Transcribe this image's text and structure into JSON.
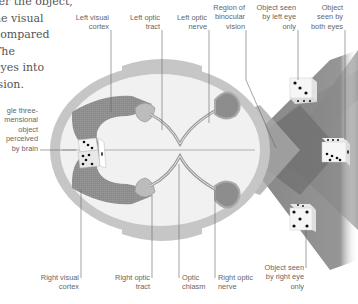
{
  "intro_text": {
    "lines": [
      "ter the object,",
      "he visual",
      "compared",
      "The",
      "eyes into",
      "ision."
    ]
  },
  "labels": {
    "left_visual_cortex": {
      "l1": "Left visual",
      "l2": "cortex"
    },
    "left_optic_tract": {
      "l1": "Left optic",
      "l2": "tract"
    },
    "left_optic_nerve": {
      "l1": "Left optic",
      "l2": "nerve"
    },
    "binocular_region": {
      "l1": "Region of",
      "l2": "binocular",
      "l3": "vision"
    },
    "left_eye_object": {
      "l1": "Object seen",
      "l2": "by left eye",
      "l3": "only"
    },
    "both_eyes_object": {
      "l1": "Object",
      "l2": "seen by",
      "l3": "both eyes"
    },
    "perceived_object": {
      "l1": "gle three-",
      "l2": "mensional",
      "l3": "object",
      "l4": "perceived",
      "l5": "by brain"
    },
    "right_visual_cortex": {
      "l1": "Right visual",
      "l2": "cortex"
    },
    "right_optic_tract": {
      "l1": "Right optic",
      "l2": "tract"
    },
    "optic_chiasm": {
      "l1": "Optic",
      "l2": "chiasm"
    },
    "right_optic_nerve": {
      "l1": "Right optic",
      "l2": "nerve"
    },
    "right_eye_object": {
      "l1": "Object seen",
      "l2": "by right eye",
      "l3": "only"
    }
  },
  "colors": {
    "skull": "#c8c8c8",
    "brain": "#f2f2f2",
    "pathway": "#8a8a8a",
    "field_light": "#b4b4b4",
    "field_mid": "#8f8f8f",
    "field_dark": "#6f6f6f"
  }
}
